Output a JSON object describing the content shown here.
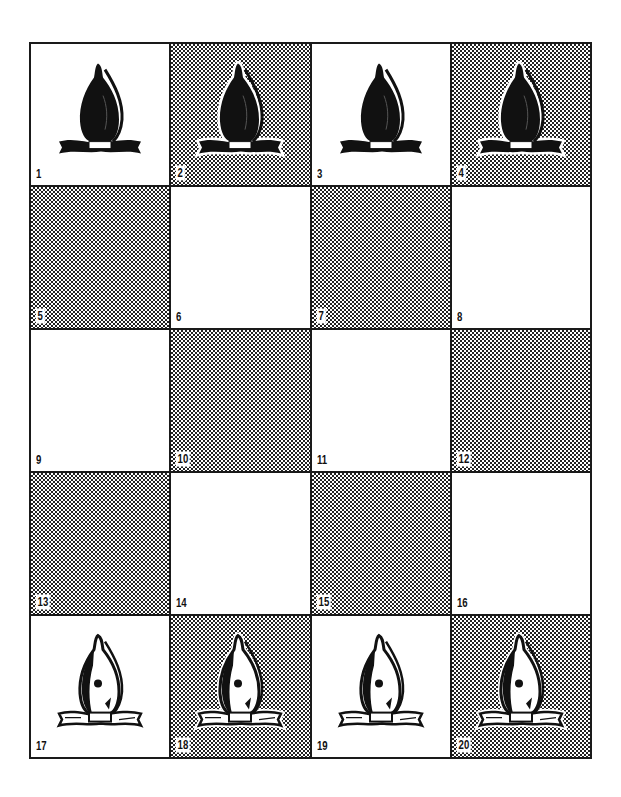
{
  "board": {
    "columns": 4,
    "rows": 5,
    "squares": [
      {
        "number": "1",
        "shade": "light",
        "piece": "black-bishop"
      },
      {
        "number": "2",
        "shade": "dark",
        "piece": "black-bishop"
      },
      {
        "number": "3",
        "shade": "light",
        "piece": "black-bishop"
      },
      {
        "number": "4",
        "shade": "dark",
        "piece": "black-bishop"
      },
      {
        "number": "5",
        "shade": "dark",
        "piece": null
      },
      {
        "number": "6",
        "shade": "light",
        "piece": null
      },
      {
        "number": "7",
        "shade": "dark",
        "piece": null
      },
      {
        "number": "8",
        "shade": "light",
        "piece": null
      },
      {
        "number": "9",
        "shade": "light",
        "piece": null
      },
      {
        "number": "10",
        "shade": "dark",
        "piece": null
      },
      {
        "number": "11",
        "shade": "light",
        "piece": null
      },
      {
        "number": "12",
        "shade": "dark",
        "piece": null
      },
      {
        "number": "13",
        "shade": "dark",
        "piece": null
      },
      {
        "number": "14",
        "shade": "light",
        "piece": null
      },
      {
        "number": "15",
        "shade": "dark",
        "piece": null
      },
      {
        "number": "16",
        "shade": "light",
        "piece": null
      },
      {
        "number": "17",
        "shade": "light",
        "piece": "white-bishop"
      },
      {
        "number": "18",
        "shade": "dark",
        "piece": "white-bishop"
      },
      {
        "number": "19",
        "shade": "light",
        "piece": "white-bishop"
      },
      {
        "number": "20",
        "shade": "dark",
        "piece": "white-bishop"
      }
    ]
  },
  "colors": {
    "ink": "#111111",
    "paper": "#ffffff"
  }
}
